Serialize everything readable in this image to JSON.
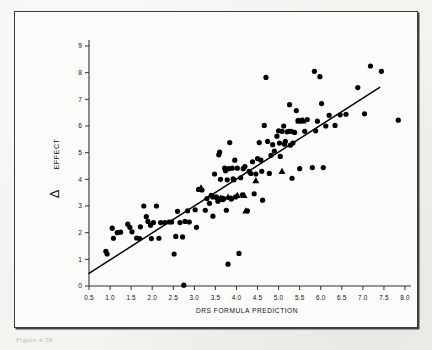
{
  "figure": {
    "caption": "Figure  4.50"
  },
  "chart_data": {
    "type": "scatter",
    "title": "",
    "xlabel": "DRS FORMULA PREDICTION",
    "ylabel": "Δ EFFECT",
    "ylabel_symbol": "Δ",
    "ylabel_text": "EFFECT",
    "xlim": [
      0.5,
      8.0
    ],
    "ylim": [
      0,
      9
    ],
    "grid": false,
    "legend": "none",
    "xticks": [
      "0.5",
      "1.0",
      "1.5",
      "2.0",
      "2.5",
      "3.0",
      "3.5",
      "4.0",
      "4.5",
      "5.0",
      "5.5",
      "6.0",
      "6.5",
      "7.0",
      "7.5",
      "8.0"
    ],
    "xtick_values": [
      0.5,
      1.0,
      1.5,
      2.0,
      2.5,
      3.0,
      3.5,
      4.0,
      4.5,
      5.0,
      5.5,
      6.0,
      6.5,
      7.0,
      7.5,
      8.0
    ],
    "yticks": [
      "0",
      "1",
      "2",
      "3",
      "4",
      "5",
      "6",
      "7",
      "8",
      "9"
    ],
    "ytick_values": [
      0,
      1,
      2,
      3,
      4,
      5,
      6,
      7,
      8,
      9
    ],
    "marker_color": "#000000",
    "line_color": "#000000",
    "axis_color": "#333333",
    "series": [
      {
        "name": "circles",
        "marker": "circle",
        "points": [
          [
            0.9,
            1.3
          ],
          [
            0.93,
            1.2
          ],
          [
            1.05,
            2.17
          ],
          [
            1.08,
            1.79
          ],
          [
            1.17,
            2.0
          ],
          [
            1.25,
            2.02
          ],
          [
            1.42,
            2.32
          ],
          [
            1.47,
            2.2
          ],
          [
            1.52,
            2.03
          ],
          [
            1.63,
            1.8
          ],
          [
            1.7,
            1.78
          ],
          [
            1.72,
            2.22
          ],
          [
            1.8,
            3.0
          ],
          [
            1.86,
            2.6
          ],
          [
            1.9,
            2.42
          ],
          [
            1.96,
            2.28
          ],
          [
            2.03,
            2.38
          ],
          [
            2.1,
            3.0
          ],
          [
            2.16,
            1.79
          ],
          [
            2.2,
            2.38
          ],
          [
            2.4,
            2.4
          ],
          [
            2.46,
            2.4
          ],
          [
            2.52,
            1.2
          ],
          [
            2.56,
            1.86
          ],
          [
            2.6,
            2.8
          ],
          [
            2.66,
            2.38
          ],
          [
            2.72,
            1.84
          ],
          [
            2.75,
            0.03
          ],
          [
            2.78,
            2.42
          ],
          [
            2.84,
            2.82
          ],
          [
            3.05,
            2.2
          ],
          [
            3.1,
            3.62
          ],
          [
            3.18,
            3.6
          ],
          [
            3.26,
            2.84
          ],
          [
            3.3,
            3.28
          ],
          [
            3.36,
            3.1
          ],
          [
            3.4,
            3.4
          ],
          [
            3.44,
            2.62
          ],
          [
            3.48,
            4.2
          ],
          [
            3.52,
            3.34
          ],
          [
            3.56,
            3.18
          ],
          [
            3.58,
            4.92
          ],
          [
            3.6,
            5.02
          ],
          [
            3.62,
            4.0
          ],
          [
            3.64,
            3.26
          ],
          [
            3.66,
            3.3
          ],
          [
            3.68,
            3.24
          ],
          [
            3.7,
            3.28
          ],
          [
            3.72,
            4.42
          ],
          [
            3.74,
            4.32
          ],
          [
            3.76,
            2.84
          ],
          [
            3.78,
            3.98
          ],
          [
            3.8,
            0.82
          ],
          [
            3.82,
            4.4
          ],
          [
            3.84,
            5.38
          ],
          [
            3.86,
            3.3
          ],
          [
            3.88,
            3.26
          ],
          [
            3.9,
            4.42
          ],
          [
            3.92,
            4.02
          ],
          [
            3.94,
            3.98
          ],
          [
            3.96,
            4.72
          ],
          [
            3.98,
            3.34
          ],
          [
            4.02,
            4.42
          ],
          [
            4.06,
            1.22
          ],
          [
            4.1,
            4.06
          ],
          [
            4.14,
            3.42
          ],
          [
            4.2,
            4.48
          ],
          [
            4.26,
            2.82
          ],
          [
            4.3,
            4.3
          ],
          [
            4.34,
            4.22
          ],
          [
            4.38,
            4.66
          ],
          [
            4.42,
            3.46
          ],
          [
            4.46,
            4.2
          ],
          [
            4.5,
            4.78
          ],
          [
            4.54,
            5.38
          ],
          [
            4.58,
            4.72
          ],
          [
            4.62,
            3.22
          ],
          [
            4.66,
            6.02
          ],
          [
            4.7,
            7.82
          ],
          [
            4.74,
            5.42
          ],
          [
            4.78,
            4.22
          ],
          [
            4.82,
            4.9
          ],
          [
            4.86,
            5.3
          ],
          [
            4.9,
            5.06
          ],
          [
            4.96,
            5.62
          ],
          [
            5.0,
            5.82
          ],
          [
            5.04,
            4.86
          ],
          [
            5.08,
            5.8
          ],
          [
            5.12,
            6.0
          ],
          [
            5.16,
            5.42
          ],
          [
            5.2,
            5.78
          ],
          [
            5.24,
            5.8
          ],
          [
            5.26,
            6.8
          ],
          [
            5.28,
            5.28
          ],
          [
            5.3,
            5.8
          ],
          [
            5.32,
            4.04
          ],
          [
            5.34,
            5.36
          ],
          [
            5.38,
            5.76
          ],
          [
            5.42,
            6.58
          ],
          [
            5.46,
            6.2
          ],
          [
            5.5,
            4.4
          ],
          [
            5.56,
            6.22
          ],
          [
            5.62,
            5.8
          ],
          [
            5.68,
            6.24
          ],
          [
            5.8,
            4.44
          ],
          [
            5.85,
            8.05
          ],
          [
            5.88,
            5.82
          ],
          [
            5.92,
            6.18
          ],
          [
            5.98,
            7.85
          ],
          [
            6.02,
            6.84
          ],
          [
            6.06,
            4.44
          ],
          [
            6.12,
            6.0
          ],
          [
            6.2,
            6.4
          ],
          [
            6.34,
            6.02
          ],
          [
            6.46,
            6.42
          ],
          [
            6.6,
            6.44
          ],
          [
            6.88,
            7.44
          ],
          [
            7.04,
            6.46
          ],
          [
            7.18,
            8.25
          ],
          [
            7.44,
            8.05
          ],
          [
            7.84,
            6.22
          ],
          [
            2.3,
            2.38
          ],
          [
            1.98,
            1.78
          ],
          [
            3.02,
            2.86
          ],
          [
            4.16,
            4.4
          ],
          [
            5.02,
            5.36
          ],
          [
            3.44,
            3.34
          ],
          [
            3.54,
            3.3
          ],
          [
            4.6,
            4.3
          ],
          [
            5.14,
            5.32
          ],
          [
            2.88,
            2.4
          ]
        ]
      },
      {
        "name": "triangles",
        "marker": "triangle",
        "points": [
          [
            3.16,
            3.68
          ],
          [
            3.62,
            3.3
          ],
          [
            3.8,
            3.34
          ],
          [
            4.02,
            3.4
          ],
          [
            4.18,
            3.4
          ],
          [
            4.22,
            2.82
          ],
          [
            4.46,
            3.96
          ],
          [
            5.48,
            6.2
          ],
          [
            5.58,
            6.2
          ],
          [
            5.08,
            4.3
          ]
        ]
      }
    ],
    "trendline": {
      "name": "regression-line",
      "x0": 0.5,
      "y0": 0.47,
      "x1": 7.4,
      "y1": 7.45
    }
  }
}
